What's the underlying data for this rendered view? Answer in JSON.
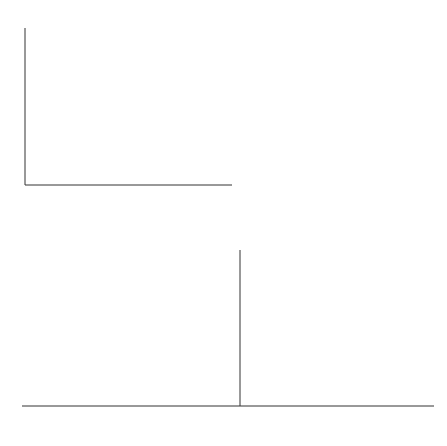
{
  "chart_data": [
    {
      "type": "line",
      "title": "JFET drain characteristics",
      "xlabel_main": "V",
      "xlabel_sub": "DS",
      "xlabel_unit": "(V)",
      "ylabel_main": "I",
      "ylabel_sub": "D",
      "ylabel_unit": "(mA)",
      "xlim": [
        0,
        20
      ],
      "ylim": [
        0,
        22
      ],
      "xticks": [
        "10",
        "20"
      ],
      "yticks": [
        "0",
        "10",
        "20"
      ],
      "grid": false,
      "series": [
        {
          "name": "V_GS = +2 V",
          "label_prefix": "V",
          "label_sub": "GS",
          "label": "= +2 V ·",
          "x": [
            0,
            1.0,
            1.5,
            2.5,
            5,
            10,
            20
          ],
          "values": [
            0,
            15,
            19,
            20,
            20.4,
            21.0,
            22.2
          ]
        },
        {
          "name": "+1 V",
          "label": "+1 V",
          "x": [
            0,
            0.7,
            1.2,
            2,
            5,
            10,
            20
          ],
          "values": [
            0,
            11,
            14,
            14.8,
            15.2,
            16.0,
            17.9
          ]
        },
        {
          "name": "0 V",
          "label": "0 V",
          "x": [
            0,
            0.5,
            0.9,
            1.6,
            5,
            10,
            20
          ],
          "values": [
            0,
            7,
            9.5,
            10.3,
            10.8,
            11.6,
            13.5
          ]
        },
        {
          "name": "-1 V",
          "label": "−1 V",
          "x": [
            0,
            0.3,
            0.6,
            1.2,
            5,
            10,
            20
          ],
          "values": [
            0,
            3.5,
            5.3,
            5.9,
            6.5,
            7.3,
            9.0
          ]
        },
        {
          "name": "-2 V",
          "label": "−2 V",
          "x": [
            0,
            0.3,
            0.6,
            1.0,
            5,
            10,
            20
          ],
          "values": [
            0,
            1.8,
            2.6,
            2.9,
            3.3,
            3.9,
            5.2
          ]
        },
        {
          "name": "-3 V",
          "label": "−3 V",
          "x": [
            0,
            0.3,
            0.6,
            5,
            10,
            20
          ],
          "values": [
            0,
            0.8,
            1.1,
            1.5,
            2.0,
            3.0
          ]
        },
        {
          "name": "-4 V",
          "label": "−4 V",
          "x": [
            0,
            0.3,
            5,
            10,
            20
          ],
          "values": [
            0,
            0.35,
            0.6,
            0.9,
            1.6
          ]
        }
      ]
    },
    {
      "type": "line",
      "title": "JFET transfer characteristic",
      "xlabel_main": "V",
      "xlabel_sub": "GS",
      "xlabel_unit": "(V)",
      "ylabel_main": "I",
      "ylabel_sub": "D",
      "ylabel_unit": "(mA)",
      "xlim": [
        -4,
        3.5
      ],
      "ylim": [
        0,
        22
      ],
      "xticks": [
        "−4",
        "−3",
        "−2",
        "−1",
        "1",
        "2",
        "3"
      ],
      "yticks": [
        "10",
        "20"
      ],
      "grid": false,
      "series": [
        {
          "name": "I_D vs V_GS",
          "x": [
            -4,
            -3.5,
            -3,
            -2.5,
            -2,
            -1.5,
            -1,
            -0.5,
            0,
            0.5,
            1,
            1.5,
            2
          ],
          "values": [
            0,
            0.4,
            1.3,
            2.4,
            3.6,
            5.0,
            6.5,
            8.0,
            9.6,
            11.7,
            14.0,
            16.6,
            19.8
          ]
        }
      ]
    }
  ]
}
